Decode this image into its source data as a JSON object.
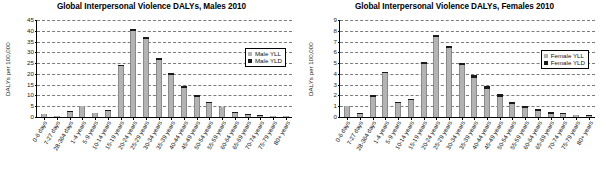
{
  "chart_data": [
    {
      "type": "bar",
      "title": "Global Interpersonal Violence DALYs, Males 2010",
      "xlabel": "",
      "ylabel": "DALYs per 100,000",
      "ylim": [
        0,
        45
      ],
      "yticks": [
        0,
        5,
        10,
        15,
        20,
        25,
        30,
        35,
        40,
        45
      ],
      "grid": true,
      "stacked": true,
      "legend_position": "right-top-inside",
      "categories": [
        "0-6 days",
        "7-27 days",
        "28-364 days",
        "1-4 years",
        "5-9 years",
        "10-14 years",
        "15-19 years",
        "20-24 years",
        "25-29 years",
        "30-34 years",
        "35-39 years",
        "40-44 years",
        "45-49 years",
        "50-54 years",
        "55-59 years",
        "60-64 years",
        "65-69 years",
        "70-74 years",
        "75-79 years",
        "80+ years"
      ],
      "series": [
        {
          "name": "Male YLL",
          "color": "#b3b3b3",
          "values": [
            1.3,
            0.4,
            2.3,
            4.9,
            1.7,
            2.9,
            23.2,
            39.4,
            35.9,
            26.3,
            19.3,
            13.5,
            9.4,
            6.6,
            4.4,
            1.9,
            1.1,
            0.6,
            0.5,
            0.3
          ]
        },
        {
          "name": "Male YLD",
          "color": "#1a1a1a",
          "values": [
            0.2,
            0.15,
            0.25,
            0.35,
            0.3,
            0.35,
            0.8,
            0.9,
            0.9,
            1.0,
            0.8,
            0.8,
            0.9,
            0.5,
            0.4,
            0.3,
            0.25,
            0.2,
            0.15,
            0.1
          ]
        }
      ],
      "totals": [
        1.5,
        0.55,
        2.55,
        5.25,
        2.0,
        3.25,
        24.0,
        40.3,
        36.8,
        27.3,
        20.1,
        14.3,
        10.3,
        7.1,
        4.8,
        2.2,
        1.35,
        0.8,
        0.65,
        0.4
      ]
    },
    {
      "type": "bar",
      "title": "Global Interpersonal Violence DALYs, Females 2010",
      "xlabel": "",
      "ylabel": "DALYs per 100,000",
      "ylim": [
        0,
        9
      ],
      "yticks": [
        0,
        1,
        2,
        3,
        4,
        5,
        6,
        7,
        8,
        9
      ],
      "grid": true,
      "stacked": true,
      "legend_position": "right-top-inside",
      "categories": [
        "0-6 days",
        "7-27 days",
        "28-364 days",
        "1-4 years",
        "5-9 years",
        "10-14 years",
        "15-19 years",
        "20-24 years",
        "25-29 years",
        "30-34 years",
        "35-39 years",
        "40-44 years",
        "45-49 years",
        "50-54 years",
        "55-59 years",
        "60-64 years",
        "65-69 years",
        "70-74 years",
        "75-79 years",
        "80+ years"
      ],
      "series": [
        {
          "name": "Female YLL",
          "color": "#b3b3b3",
          "values": [
            0.97,
            0.31,
            1.88,
            4.0,
            1.28,
            1.53,
            4.9,
            7.35,
            6.3,
            4.8,
            3.6,
            2.55,
            1.85,
            1.2,
            0.85,
            0.55,
            0.3,
            0.25,
            0.15,
            0.1
          ]
        },
        {
          "name": "Female YLD",
          "color": "#1a1a1a",
          "values": [
            0.08,
            0.06,
            0.1,
            0.13,
            0.14,
            0.12,
            0.18,
            0.22,
            0.23,
            0.2,
            0.28,
            0.28,
            0.27,
            0.22,
            0.18,
            0.15,
            0.12,
            0.12,
            0.08,
            0.06
          ]
        },
        {}
      ],
      "totals": [
        1.05,
        0.37,
        1.98,
        4.13,
        1.42,
        1.65,
        5.08,
        7.57,
        6.53,
        5.0,
        3.88,
        2.83,
        2.12,
        1.42,
        1.03,
        0.7,
        0.42,
        0.37,
        0.23,
        0.16
      ]
    }
  ],
  "panels": [
    {
      "title": "Global Interpersonal Violence DALYs, Males 2010",
      "ylabel": "DALYs per 100,000",
      "legend": [
        {
          "label": "Male YLL",
          "swatch": "yll"
        },
        {
          "label": "Male YLD",
          "swatch": "yld"
        }
      ]
    },
    {
      "title": "Global Interpersonal Violence DALYs, Females 2010",
      "ylabel": "DALYs per 100,000",
      "legend": [
        {
          "label": "Female YLL",
          "swatch": "yll"
        },
        {
          "label": "Female YLD",
          "swatch": "yld"
        }
      ]
    }
  ],
  "colors": {
    "yll": "#b3b3b3",
    "yld": "#1a1a1a",
    "grid": "#7b7b7b",
    "axis": "#000000",
    "background": "#ffffff"
  }
}
